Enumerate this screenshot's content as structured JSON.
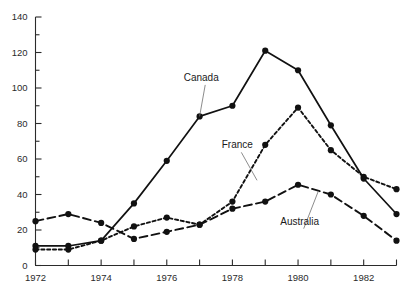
{
  "chart_data": {
    "type": "line",
    "title": "",
    "subtitle": "",
    "xlabel": "",
    "ylabel": "",
    "x": [
      1972,
      1973,
      1974,
      1975,
      1976,
      1977,
      1978,
      1979,
      1980,
      1981,
      1982,
      1983
    ],
    "xtick_labels": [
      "1972",
      "",
      "1974",
      "",
      "1976",
      "",
      "1978",
      "",
      "1980",
      "",
      "1982",
      ""
    ],
    "xtick_labels_shown": [
      "1972",
      "1974",
      "1976",
      "1978",
      "1980",
      "1982"
    ],
    "ytick_labels": [
      "0",
      "20",
      "40",
      "60",
      "80",
      "100",
      "120",
      "140"
    ],
    "ytick_values": [
      0,
      20,
      40,
      60,
      80,
      100,
      120,
      140
    ],
    "yminor_values": [
      10,
      30,
      50,
      70,
      90,
      110,
      130
    ],
    "xlim": [
      1972,
      1983
    ],
    "ylim": [
      0,
      140
    ],
    "grid": false,
    "legend": "inline-annotations",
    "series": [
      {
        "name": "Canada",
        "style": "solid",
        "color": "#111111",
        "marker": "filled-circle",
        "values": [
          11,
          11,
          14,
          35,
          59,
          84,
          90,
          121,
          110,
          79,
          49,
          29
        ]
      },
      {
        "name": "France",
        "style": "dotted",
        "color": "#111111",
        "marker": "filled-circle",
        "values": [
          9,
          9,
          14,
          22,
          27,
          23,
          36,
          68,
          89,
          65,
          50,
          43
        ]
      },
      {
        "name": "Australia",
        "style": "dashed",
        "color": "#111111",
        "marker": "filled-circle",
        "values": [
          25,
          29,
          24,
          15,
          19,
          23,
          32,
          36,
          45.5,
          40,
          28,
          14
        ]
      }
    ],
    "annotations": [
      {
        "text": "Canada",
        "label_x": 1977.05,
        "label_y": 104,
        "point_x": 1977.0,
        "point_y": 84
      },
      {
        "text": "France",
        "label_x": 1978.15,
        "label_y": 66,
        "point_x": 1978.75,
        "point_y": 48
      },
      {
        "text": "Australia",
        "label_x": 1980.05,
        "label_y": 23,
        "point_x": 1980.62,
        "point_y": 42
      }
    ]
  }
}
